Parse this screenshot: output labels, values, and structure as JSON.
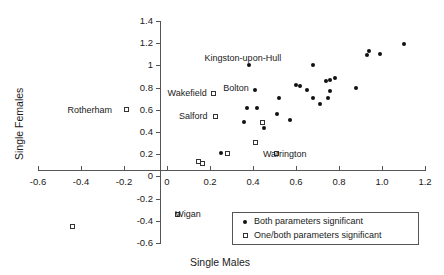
{
  "chart_data": {
    "type": "scatter",
    "title": "",
    "xlabel": "Single Males",
    "ylabel": "Single Females",
    "xlim": [
      -0.6,
      1.2
    ],
    "ylim": [
      -0.6,
      1.4
    ],
    "grid": false,
    "xticks": [
      "-0.6",
      "-0.4",
      "-0.2",
      "0",
      "0.2",
      "0.4",
      "0.6",
      "0.8",
      "1.0",
      "1.2"
    ],
    "xtick_values": [
      -0.6,
      -0.4,
      -0.2,
      0,
      0.2,
      0.4,
      0.6,
      0.8,
      1.0,
      1.2
    ],
    "yticks": [
      "1.4",
      "1.2",
      "1",
      "0.8",
      "0.6",
      "0.4",
      "0.2",
      "0",
      "-0.2",
      "-0.4",
      "-0.6"
    ],
    "ytick_values": [
      1.4,
      1.2,
      1.0,
      0.8,
      0.6,
      0.4,
      0.2,
      0,
      -0.2,
      -0.4,
      -0.6
    ],
    "legend_position": "bottom-right",
    "series": [
      {
        "name": "Both parameters significant",
        "marker": "filled-circle",
        "color": "#111111",
        "points": [
          {
            "x": 0.25,
            "y": 0.21
          },
          {
            "x": 0.36,
            "y": 0.49
          },
          {
            "x": 0.37,
            "y": 0.62
          },
          {
            "x": 0.38,
            "y": 1.0,
            "label": "Kingston-upon-Hull"
          },
          {
            "x": 0.41,
            "y": 0.78
          },
          {
            "x": 0.42,
            "y": 0.62
          },
          {
            "x": 0.45,
            "y": 0.44
          },
          {
            "x": 0.51,
            "y": 0.56
          },
          {
            "x": 0.52,
            "y": 0.71
          },
          {
            "x": 0.57,
            "y": 0.51
          },
          {
            "x": 0.6,
            "y": 0.82
          },
          {
            "x": 0.62,
            "y": 0.81
          },
          {
            "x": 0.65,
            "y": 0.78
          },
          {
            "x": 0.68,
            "y": 0.71
          },
          {
            "x": 0.68,
            "y": 1.0
          },
          {
            "x": 0.71,
            "y": 0.65
          },
          {
            "x": 0.74,
            "y": 0.86
          },
          {
            "x": 0.75,
            "y": 0.71
          },
          {
            "x": 0.76,
            "y": 0.87
          },
          {
            "x": 0.76,
            "y": 0.77
          },
          {
            "x": 0.78,
            "y": 0.89
          },
          {
            "x": 0.88,
            "y": 0.8
          },
          {
            "x": 0.93,
            "y": 1.09
          },
          {
            "x": 0.94,
            "y": 1.13
          },
          {
            "x": 0.99,
            "y": 1.1
          },
          {
            "x": 1.1,
            "y": 1.19
          }
        ]
      },
      {
        "name": "One/both parameters significant",
        "marker": "open-square",
        "color": "#333333",
        "points": [
          {
            "x": -0.44,
            "y": -0.45
          },
          {
            "x": -0.19,
            "y": 0.6,
            "label": "Rotherham",
            "label_pos": "left"
          },
          {
            "x": 0.05,
            "y": -0.34,
            "label": "Wigan",
            "label_pos": "right"
          },
          {
            "x": 0.145,
            "y": 0.135
          },
          {
            "x": 0.165,
            "y": 0.115
          },
          {
            "x": 0.215,
            "y": 0.75,
            "label": "Wakefield",
            "label_pos": "left"
          },
          {
            "x": 0.225,
            "y": 0.54,
            "label": "Salford",
            "label_pos": "left"
          },
          {
            "x": 0.28,
            "y": 0.21
          },
          {
            "x": 0.41,
            "y": 0.305
          },
          {
            "x": 0.445,
            "y": 0.485
          },
          {
            "x": 0.51,
            "y": 0.205,
            "label": "Warrington",
            "label_pos": "right"
          }
        ]
      }
    ],
    "annotations": [
      {
        "text": "Kingston-upon-Hull",
        "x": 0.38,
        "y": 1.07
      },
      {
        "text": "Bolton",
        "x": 0.33,
        "y": 0.8
      },
      {
        "text": "Wakefield",
        "x": 0.105,
        "y": 0.75
      },
      {
        "text": "Salford",
        "x": 0.135,
        "y": 0.54
      },
      {
        "text": "Rotherham",
        "x": -0.36,
        "y": 0.6
      },
      {
        "text": "Warrington",
        "x": 0.56,
        "y": 0.205
      },
      {
        "text": "Wigan",
        "x": 0.095,
        "y": -0.34
      }
    ],
    "bolton_point": {
      "x": 0.41,
      "y": 0.78
    }
  },
  "legend": {
    "items": [
      {
        "symbol": "filled-circle",
        "label": "Both parameters significant"
      },
      {
        "symbol": "open-square",
        "label": "One/both parameters significant"
      }
    ]
  }
}
